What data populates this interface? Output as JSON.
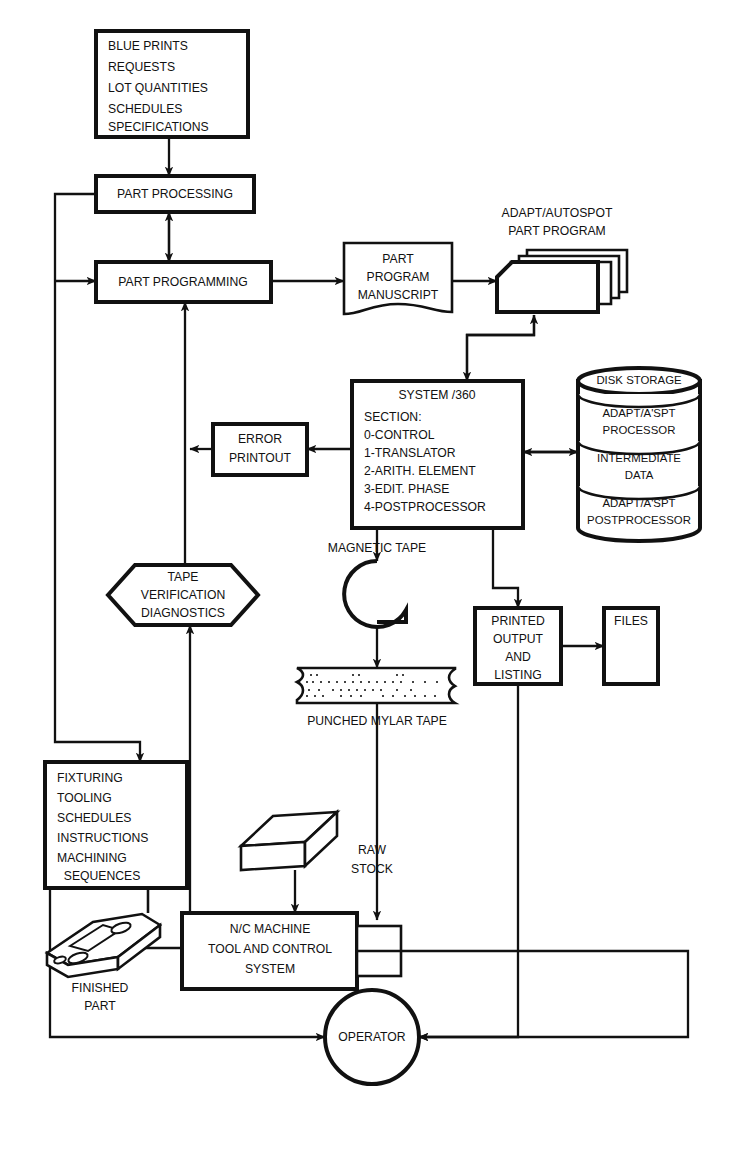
{
  "diagram": {
    "background": "#ffffff",
    "line_color": "#111111",
    "nodes": {
      "inputs": {
        "shape": "rectangle",
        "lines": [
          "BLUE PRINTS",
          "REQUESTS",
          "LOT QUANTITIES",
          "SCHEDULES",
          "SPECIFICATIONS"
        ]
      },
      "part_processing": {
        "shape": "rectangle",
        "lines": [
          "PART PROCESSING"
        ]
      },
      "part_programming": {
        "shape": "rectangle",
        "lines": [
          "PART PROGRAMMING"
        ]
      },
      "manuscript": {
        "shape": "document",
        "lines": [
          "PART",
          "PROGRAM",
          "MANUSCRIPT"
        ]
      },
      "card_deck": {
        "shape": "punched-card-deck",
        "caption": [
          "ADAPT/AUTOSPOT",
          "PART PROGRAM"
        ]
      },
      "system360": {
        "shape": "rectangle",
        "title": "SYSTEM  /360",
        "lines": [
          "SECTION:",
          "0-CONTROL",
          "1-TRANSLATOR",
          "2-ARITH. ELEMENT",
          "3-EDIT. PHASE",
          "4-POSTPROCESSOR"
        ]
      },
      "disk_storage": {
        "shape": "cylinder-stack",
        "header": "DISK STORAGE",
        "sections": [
          [
            "ADAPT/A'SPT",
            "PROCESSOR"
          ],
          [
            "INTERMEDIATE",
            "DATA"
          ],
          [
            "ADAPT/A'SPT",
            "POSTPROCESSOR"
          ]
        ]
      },
      "error_printout": {
        "shape": "rectangle",
        "lines": [
          "ERROR",
          "PRINTOUT"
        ]
      },
      "tape_verification": {
        "shape": "hexagon",
        "lines": [
          "TAPE",
          "VERIFICATION",
          "DIAGNOSTICS"
        ]
      },
      "magnetic_tape": {
        "shape": "tape-reel",
        "caption": "MAGNETIC TAPE"
      },
      "punched_tape": {
        "shape": "punched-tape",
        "caption": "PUNCHED MYLAR TAPE"
      },
      "printed_output": {
        "shape": "rectangle",
        "lines": [
          "PRINTED",
          "OUTPUT",
          "AND",
          "LISTING"
        ]
      },
      "files": {
        "shape": "rectangle",
        "lines": [
          "FILES"
        ]
      },
      "fixturing": {
        "shape": "rectangle",
        "lines": [
          "FIXTURING",
          "TOOLING",
          "SCHEDULES",
          "INSTRUCTIONS",
          "MACHINING",
          "  SEQUENCES"
        ]
      },
      "raw_stock": {
        "shape": "solid-bar",
        "caption": [
          "RAW",
          "STOCK"
        ]
      },
      "nc_machine": {
        "shape": "rectangle",
        "lines": [
          "N/C MACHINE",
          "TOOL AND CONTROL",
          "SYSTEM"
        ]
      },
      "tape_reader": {
        "shape": "rectangle",
        "lines": []
      },
      "finished_part": {
        "shape": "machined-part",
        "caption": [
          "FINISHED",
          "PART"
        ]
      },
      "operator": {
        "shape": "circle",
        "lines": [
          "OPERATOR"
        ]
      }
    }
  }
}
